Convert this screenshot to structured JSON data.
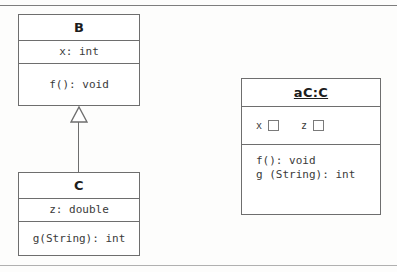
{
  "page": {
    "background": "#fdfdfc",
    "line_color": "#6e6e6e",
    "text_color": "#3a3a3a"
  },
  "classes": {
    "b": {
      "name": "B",
      "attributes": [
        "x: int"
      ],
      "operations": [
        "f(): void"
      ]
    },
    "c": {
      "name": "C",
      "attributes": [
        "z: double"
      ],
      "operations": [
        "g(String): int"
      ]
    }
  },
  "object": {
    "name": "aC:C",
    "slots": [
      {
        "name": "x",
        "value": ""
      },
      {
        "name": "z",
        "value": ""
      }
    ],
    "operations_text": "f(): void\ng (String): int"
  },
  "relationship": {
    "type": "generalization",
    "from": "C",
    "to": "B",
    "arrow": "hollow-triangle"
  }
}
